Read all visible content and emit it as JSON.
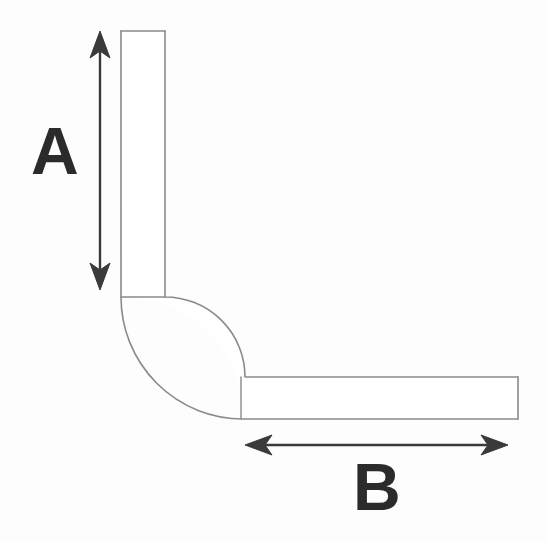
{
  "diagram": {
    "type": "technical-line-drawing",
    "background_color": "#fdfdfd",
    "outline_color": "#8a8a8a",
    "annotation_color": "#2b2b2b",
    "fill_color": "#ffffff",
    "width": 548,
    "height": 542
  },
  "shape": {
    "vertical_arm": {
      "name": "vertical-arm",
      "left": 121,
      "right": 165,
      "top": 31,
      "bottom": 297,
      "thickness": 44
    },
    "horizontal_arm": {
      "name": "horizontal-arm",
      "left": 240,
      "right": 518,
      "top": 377,
      "bottom": 418,
      "thickness": 41
    },
    "elbow": {
      "name": "elbow-bend",
      "center_x": 165,
      "center_y": 377,
      "inner_radius": 80,
      "outer_radius": 122,
      "sweep_degrees": 90
    },
    "tangent_lines": [
      {
        "name": "upper-tangent-line",
        "x1": 121,
        "y1": 297,
        "x2": 165,
        "y2": 297
      },
      {
        "name": "lower-tangent-line",
        "x1": 240,
        "y1": 377,
        "x2": 240,
        "y2": 418
      }
    ]
  },
  "dimensions": [
    {
      "id": "a",
      "label": "A",
      "orientation": "vertical",
      "measures": "vertical-arm-length",
      "arrow_heads": "double",
      "line": {
        "x1": 100,
        "y1": 33,
        "x2": 100,
        "y2": 288
      },
      "label_position": {
        "x": 31,
        "y": 118
      },
      "font_size": 66
    },
    {
      "id": "b",
      "label": "B",
      "orientation": "horizontal",
      "measures": "horizontal-arm-length",
      "arrow_heads": "double",
      "line": {
        "x1": 245,
        "y1": 445,
        "x2": 508,
        "y2": 445
      },
      "label_position": {
        "x": 353,
        "y": 454
      },
      "font_size": 66
    }
  ],
  "colors": {
    "outline": "#8a8a8a",
    "annotation": "#2b2b2b",
    "background": "#fdfdfd",
    "fill": "#ffffff"
  }
}
